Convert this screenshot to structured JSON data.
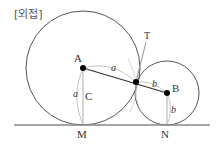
{
  "title": "[외접]",
  "labels": {
    "A": "A",
    "B": "B",
    "C": "C",
    "M": "M",
    "N": "N",
    "T": "T",
    "a_top": "a",
    "a_left": "a",
    "b_top": "b",
    "b_right": "b"
  },
  "colors": {
    "stroke": "#555555",
    "light_stroke": "#999999",
    "point": "#000000",
    "baseline": "#888888"
  }
}
